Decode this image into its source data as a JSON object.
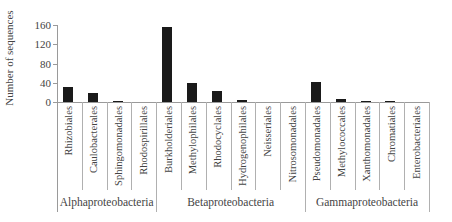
{
  "chart_data": {
    "type": "bar",
    "title": "",
    "xlabel": "",
    "ylabel": "Number of sequences",
    "ylim": [
      0,
      160
    ],
    "yticks": [
      0,
      40,
      80,
      120,
      160
    ],
    "grid": false,
    "legend": null,
    "categories": [
      "Rhizobiales",
      "Caulobacterales",
      "Sphingomonadales",
      "Rhodospirillales",
      "Burkholderiales",
      "Methylophilales",
      "Rhodocyclales",
      "Hydrogenophilales",
      "Neisseriales",
      "Nitrosomonadales",
      "Pseudomonadales",
      "Methylococcales",
      "Xanthomonadales",
      "Chromatiales",
      "Enterobacteriales"
    ],
    "values": [
      31,
      19,
      3,
      0,
      156,
      39,
      22,
      4,
      0,
      0,
      42,
      7,
      2,
      1,
      0
    ],
    "groups": [
      {
        "name": "Alphaproteobacteria",
        "start": 0,
        "count": 4
      },
      {
        "name": "Betaproteobacteria",
        "start": 4,
        "count": 6
      },
      {
        "name": "Gammaproteobacteria",
        "start": 10,
        "count": 5
      }
    ],
    "bar_color": "#1a1a1a",
    "axis_color": "#9a9a9a"
  }
}
